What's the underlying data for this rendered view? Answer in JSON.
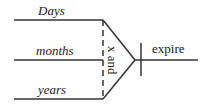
{
  "diagram": {
    "type": "syntax-tree",
    "inputs": [
      {
        "label": "Days",
        "italic": true
      },
      {
        "label": "months",
        "italic": true
      },
      {
        "label": "years",
        "italic": true
      }
    ],
    "junction_label": "x and",
    "output_label": "expire",
    "line_color": "#333333"
  }
}
